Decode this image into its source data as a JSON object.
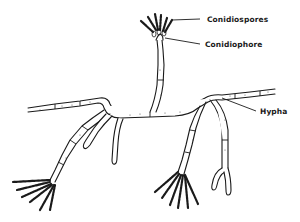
{
  "diagram": {
    "labels": {
      "conidiospores": "Conidiospores",
      "conidiophore": "Conidiophore",
      "hypha": "Hypha"
    },
    "colors": {
      "ink": "#1a1a1a",
      "background": "#ffffff"
    }
  }
}
